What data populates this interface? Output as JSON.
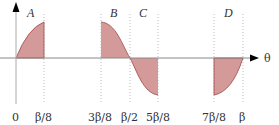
{
  "diagram": {
    "axis_label": "θ",
    "colors": {
      "fill": "#d49a9a",
      "curve": "#a04848",
      "axis": "#888888",
      "arrow": "#000000",
      "guide": "#bbbbbb"
    },
    "regions": [
      {
        "label": "A",
        "from": "0",
        "to": "β/8",
        "sign": "positive"
      },
      {
        "label": "B",
        "from": "3β/8",
        "to": "β/2",
        "sign": "positive"
      },
      {
        "label": "C",
        "from": "β/2",
        "to": "5β/8",
        "sign": "negative"
      },
      {
        "label": "D",
        "from": "7β/8",
        "to": "β",
        "sign": "negative"
      }
    ],
    "ticks": [
      {
        "label": "0"
      },
      {
        "label": "β/8"
      },
      {
        "label": "3β/8"
      },
      {
        "label": "β/2"
      },
      {
        "label": "5β/8"
      },
      {
        "label": "7β/8"
      },
      {
        "label": "β"
      }
    ]
  }
}
